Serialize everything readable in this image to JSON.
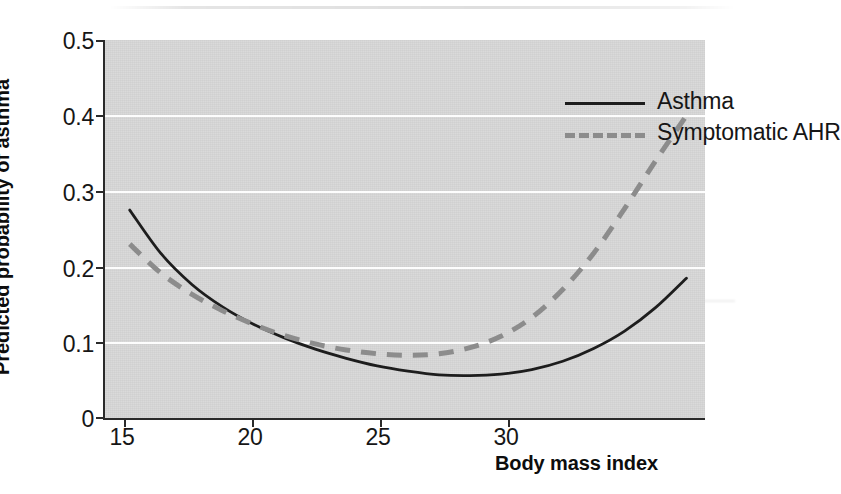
{
  "chart_data": {
    "type": "line",
    "title": "",
    "subtitle": "",
    "xlabel": "Body mass index",
    "ylabel": "Predicted probability of asthma",
    "xlim": [
      14.2,
      33.6
    ],
    "ylim": [
      0,
      0.5
    ],
    "xticks": [
      15,
      20,
      25,
      30
    ],
    "xtick_labels": [
      "15",
      "20",
      "25",
      "30"
    ],
    "yticks": [
      0,
      0.1,
      0.2,
      0.3,
      0.4,
      0.5
    ],
    "ytick_labels": [
      "0",
      "0.1",
      "0.2",
      "0.3",
      "0.4",
      "0.5"
    ],
    "grid": "horizontal-white-gridlines",
    "legend_position": "top-right-inside",
    "plot_background": "#d8d8d8",
    "series": [
      {
        "name": "Asthma",
        "style": "solid",
        "color": "#1d1d1d",
        "x": [
          15,
          16,
          17,
          18,
          19,
          20,
          21,
          22,
          23,
          24,
          25,
          26,
          27,
          28,
          29,
          30,
          31,
          32,
          33
        ],
        "values": [
          0.275,
          0.218,
          0.177,
          0.147,
          0.124,
          0.106,
          0.091,
          0.079,
          0.069,
          0.062,
          0.057,
          0.056,
          0.058,
          0.064,
          0.075,
          0.092,
          0.115,
          0.146,
          0.185
        ]
      },
      {
        "name": "Symptomatic AHR",
        "style": "dashed",
        "color": "#8c8c8c",
        "x": [
          15,
          16,
          17,
          18,
          19,
          20,
          21,
          22,
          23,
          24,
          25,
          26,
          27,
          28,
          29,
          30,
          31,
          32,
          33
        ],
        "values": [
          0.23,
          0.192,
          0.164,
          0.142,
          0.124,
          0.109,
          0.098,
          0.09,
          0.085,
          0.083,
          0.085,
          0.093,
          0.108,
          0.133,
          0.17,
          0.218,
          0.277,
          0.34,
          0.4
        ]
      }
    ],
    "annotations": []
  },
  "axes": {
    "ylabel": "Predicted probability of asthma",
    "xlabel": "Body mass index",
    "ytick_labels": [
      "0.5",
      "0.4",
      "0.3",
      "0.2",
      "0.1",
      "0"
    ],
    "xtick_labels": [
      "15",
      "20",
      "25",
      "30"
    ]
  },
  "legend": {
    "entries": [
      {
        "label": "Asthma",
        "style": "solid",
        "color": "#1d1d1d"
      },
      {
        "label": "Symptomatic AHR",
        "style": "dashed",
        "color": "#8c8c8c"
      }
    ]
  }
}
